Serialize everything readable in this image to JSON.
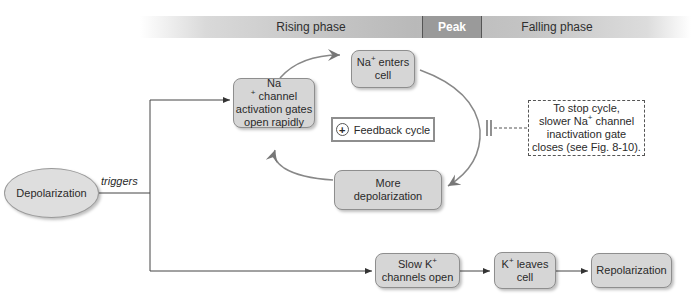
{
  "phases": {
    "rising": "Rising phase",
    "peak": "Peak",
    "falling": "Falling phase"
  },
  "nodes": {
    "depolarization": "Depolarization",
    "trigger_label": "triggers",
    "na_activation": {
      "line1_pre": "Na",
      "line1_sup": "+",
      "line1_post": " channel",
      "line2": "activation gates",
      "line3": "open rapidly"
    },
    "na_enters": {
      "line1_pre": "Na",
      "line1_sup": "+",
      "line1_post": " enters",
      "line2": "cell"
    },
    "more_depol": {
      "line1": "More",
      "line2": "depolarization"
    },
    "feedback": {
      "symbol": "+",
      "label": "Feedback cycle"
    },
    "stop_note": {
      "line1": "To stop cycle,",
      "line2_pre": "slower Na",
      "line2_sup": "+",
      "line2_post": " channel",
      "line3": "inactivation gate",
      "line4": "closes (see Fig. 8-10)."
    },
    "slow_k": {
      "line1_pre": "Slow K",
      "line1_sup": "+",
      "line2": "channels open"
    },
    "k_leaves": {
      "line1_pre": "K",
      "line1_sup": "+",
      "line1_post": " leaves",
      "line2": "cell"
    },
    "repolarization": "Repolarization"
  }
}
